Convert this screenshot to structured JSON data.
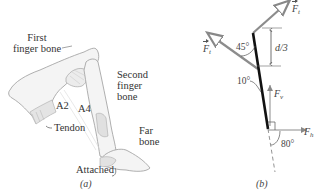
{
  "figure": {
    "panel_a": {
      "caption": "(a)",
      "labels": {
        "first_bone_line1": "First",
        "first_bone_line2": "finger bone",
        "second_bone_line1": "Second",
        "second_bone_line2": "finger",
        "second_bone_line3": "bone",
        "far_bone_line1": "Far",
        "far_bone_line2": "bone",
        "a2": "A2",
        "a4": "A4",
        "tendon": "Tendon",
        "attached": "Attached"
      }
    },
    "panel_b": {
      "caption": "(b)",
      "forces": {
        "ft_upper": "F",
        "ft_upper_sub": "t",
        "ft_left": "F",
        "ft_left_sub": "t",
        "fv": "F",
        "fv_sub": "v",
        "fh": "F",
        "fh_sub": "h"
      },
      "angles": {
        "a45": "45°",
        "a10": "10°",
        "a80": "80°"
      },
      "dimension": "d/3"
    },
    "colors": {
      "bone_fill": "#f2f2f2",
      "bone_stroke": "#9a9a9a",
      "force_arrow": "#8c8c8c",
      "bone_line": "#111111"
    }
  }
}
